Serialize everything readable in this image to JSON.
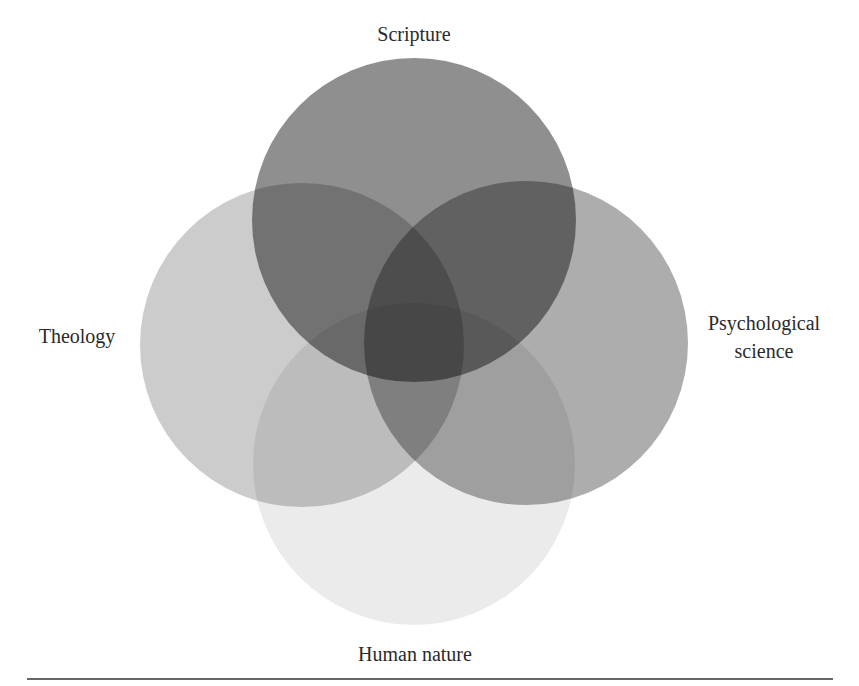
{
  "diagram": {
    "type": "venn",
    "sets": [
      {
        "id": "human-nature",
        "label": "Human nature",
        "cx": 414,
        "cy": 464,
        "r": 161,
        "opacity": 0.08
      },
      {
        "id": "theology",
        "label": "Theology",
        "cx": 302,
        "cy": 345,
        "r": 162,
        "opacity": 0.2
      },
      {
        "id": "psychological-science",
        "label_lines": [
          "Psychological",
          "science"
        ],
        "cx": 526,
        "cy": 343,
        "r": 162,
        "opacity": 0.32
      },
      {
        "id": "scripture",
        "label": "Scripture",
        "cx": 414,
        "cy": 220,
        "r": 162,
        "opacity": 0.44
      }
    ],
    "labels": {
      "scripture": "Scripture",
      "theology": "Theology",
      "psych_line1": "Psychological",
      "psych_line2": "science",
      "human_nature": "Human nature"
    },
    "colors": {
      "fill": "#000000",
      "text": "#2a2a2a",
      "rule": "#333333",
      "background": "#ffffff"
    }
  }
}
